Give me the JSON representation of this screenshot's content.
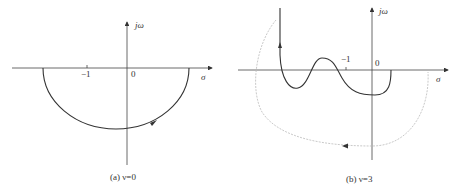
{
  "figures": [
    {
      "id": "a",
      "caption": "(a) ν=0",
      "x_axis_label": "σ",
      "y_axis_label": "jω",
      "tick_minus_one": "−1",
      "origin_label": "0",
      "curve": "semicircle below real axis, clockwise arrow"
    },
    {
      "id": "b",
      "caption": "(b) ν=3",
      "x_axis_label": "σ",
      "y_axis_label": "jω",
      "tick_minus_one": "−1",
      "origin_label": "0",
      "curve": "Nyquist plot with oscillation and dotted auxiliary arc"
    }
  ]
}
